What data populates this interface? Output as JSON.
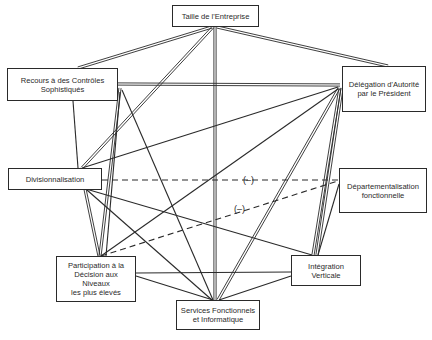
{
  "diagram": {
    "nodes": [
      {
        "id": "taille",
        "label": "Taille de l'Entreprise",
        "x": 172,
        "y": 5,
        "w": 87,
        "h": 22
      },
      {
        "id": "recours",
        "label": "Recours à des Contrôles\nSophistiqués",
        "x": 7,
        "y": 68,
        "w": 111,
        "h": 33
      },
      {
        "id": "delegation",
        "label": "Délégation d'Autorité\npar le Président",
        "x": 342,
        "y": 66,
        "w": 84,
        "h": 46
      },
      {
        "id": "division",
        "label": "Divisionnalisation",
        "x": 8,
        "y": 168,
        "w": 94,
        "h": 22
      },
      {
        "id": "departement",
        "label": "Départementalisation\nfonctionnelle",
        "x": 339,
        "y": 168,
        "w": 88,
        "h": 45
      },
      {
        "id": "participation",
        "label": "Participation à la\nDécision aux Niveaux\nles plus élevés",
        "x": 56,
        "y": 256,
        "w": 80,
        "h": 46
      },
      {
        "id": "integration",
        "label": "Intégration\nVerticale",
        "x": 291,
        "y": 255,
        "w": 70,
        "h": 31
      },
      {
        "id": "services",
        "label": "Services Fonctionnels\net Informatique",
        "x": 176,
        "y": 300,
        "w": 84,
        "h": 30
      }
    ],
    "edges": [
      {
        "from": "taille",
        "to": "recours",
        "style": "double",
        "x1": 212,
        "y1": 27,
        "x2": 78,
        "y2": 68
      },
      {
        "from": "taille",
        "to": "delegation",
        "style": "double",
        "x1": 217,
        "y1": 27,
        "x2": 388,
        "y2": 66
      },
      {
        "from": "taille",
        "to": "division",
        "style": "double",
        "x1": 213,
        "y1": 27,
        "x2": 82,
        "y2": 168
      },
      {
        "from": "taille",
        "to": "services",
        "style": "double",
        "x1": 215,
        "y1": 27,
        "x2": 215,
        "y2": 300
      },
      {
        "from": "recours",
        "to": "delegation",
        "style": "double",
        "x1": 118,
        "y1": 84,
        "x2": 340,
        "y2": 85
      },
      {
        "from": "recours",
        "to": "division",
        "style": "single",
        "x1": 73,
        "y1": 101,
        "x2": 78,
        "y2": 168
      },
      {
        "from": "recours",
        "to": "participation",
        "style": "double",
        "x1": 120,
        "y1": 88,
        "x2": 100,
        "y2": 256
      },
      {
        "from": "recours",
        "to": "services",
        "style": "single",
        "x1": 122,
        "y1": 90,
        "x2": 213,
        "y2": 300
      },
      {
        "from": "delegation",
        "to": "division",
        "style": "single",
        "x1": 338,
        "y1": 87,
        "x2": 82,
        "y2": 168
      },
      {
        "from": "delegation",
        "to": "participation",
        "style": "single",
        "x1": 338,
        "y1": 89,
        "x2": 101,
        "y2": 256
      },
      {
        "from": "delegation",
        "to": "services",
        "style": "double",
        "x1": 339,
        "y1": 88,
        "x2": 218,
        "y2": 300
      },
      {
        "from": "delegation",
        "to": "integration",
        "style": "double",
        "x1": 340,
        "y1": 88,
        "x2": 313,
        "y2": 255
      },
      {
        "from": "delegation",
        "to": "integration",
        "style": "double",
        "x1": 342,
        "y1": 88,
        "x2": 317,
        "y2": 255
      },
      {
        "from": "division",
        "to": "departement",
        "style": "dashed",
        "x1": 102,
        "y1": 180,
        "x2": 338,
        "y2": 180
      },
      {
        "from": "division",
        "to": "participation",
        "style": "double",
        "x1": 85,
        "y1": 189,
        "x2": 99,
        "y2": 256
      },
      {
        "from": "division",
        "to": "integration",
        "style": "single",
        "x1": 86,
        "y1": 189,
        "x2": 312,
        "y2": 255
      },
      {
        "from": "division",
        "to": "services",
        "style": "single",
        "x1": 87,
        "y1": 190,
        "x2": 212,
        "y2": 300
      },
      {
        "from": "participation",
        "to": "departement",
        "style": "dashed",
        "x1": 101,
        "y1": 256,
        "x2": 338,
        "y2": 181
      },
      {
        "from": "participation",
        "to": "integration",
        "style": "single",
        "x1": 136,
        "y1": 273,
        "x2": 291,
        "y2": 272
      },
      {
        "from": "participation",
        "to": "services",
        "style": "single",
        "x1": 136,
        "y1": 276,
        "x2": 213,
        "y2": 300
      },
      {
        "from": "integration",
        "to": "services",
        "style": "single",
        "x1": 291,
        "y1": 276,
        "x2": 219,
        "y2": 300
      },
      {
        "from": "integration",
        "to": "departement",
        "style": "single",
        "x1": 318,
        "y1": 255,
        "x2": 339,
        "y2": 184
      },
      {
        "from": "recours",
        "to": "participation-b",
        "style": "single",
        "x1": 120,
        "y1": 92,
        "x2": 106,
        "y2": 256
      }
    ],
    "edge_labels": [
      {
        "text": "(–)",
        "x": 243,
        "y": 175
      },
      {
        "text": "(–)",
        "x": 234,
        "y": 204
      }
    ],
    "colors": {
      "line": "#2a2a2a",
      "background": "#ffffff"
    }
  }
}
